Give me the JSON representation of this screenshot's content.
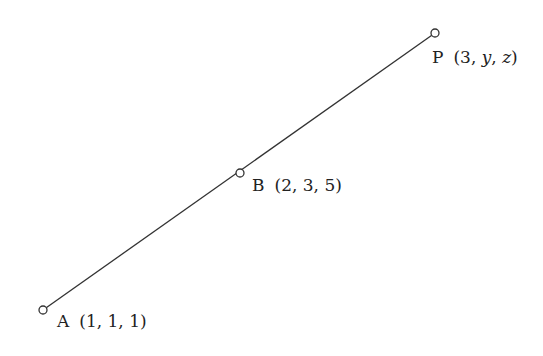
{
  "diagram": {
    "type": "line-segment-points",
    "line_color": "#333333",
    "points": [
      {
        "name": "A",
        "coords": "(1, 1, 1)",
        "x": 43,
        "y": 310
      },
      {
        "name": "B",
        "coords": "(2, 3, 5)",
        "x": 240,
        "y": 173
      },
      {
        "name": "P",
        "coords_prefix": "(3, ",
        "coords_y": "y",
        "coords_sep": ", ",
        "coords_z": "z",
        "coords_suffix": ")",
        "x": 435,
        "y": 33
      }
    ]
  }
}
